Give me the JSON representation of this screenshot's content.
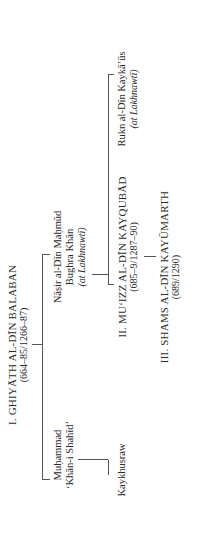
{
  "diagram": {
    "type": "genealogical-tree",
    "orientation": "rotated-90-ccw",
    "nodes": {
      "balaban": {
        "name": "I. GHIYĀTH AL-DĪN BALABAN",
        "dates": "(664–85/1266–87)"
      },
      "muhammad": {
        "line1": "Muḥammad",
        "line2": "ʻKhān-i Shahīdʼ"
      },
      "nasir": {
        "line1": "Nāṣir al-Dīn Maḥmūd",
        "line2": "Bughra Khān",
        "note": "(at Lakhnawtī)"
      },
      "kaykhusraw": {
        "name": "Kaykhusraw"
      },
      "muizz": {
        "name": "II. MUʻIZZ AL-DĪN KAYQUBĀD",
        "dates": "(685–9/1287–90)"
      },
      "rukn": {
        "name": "Rukn al-Dīn Kaykāʼūs",
        "note": "(at Lakhnawtī)"
      },
      "shams": {
        "name": "III. SHAMS AL-DĪN KAYŪMARTH",
        "dates": "(689/1290)"
      }
    },
    "edges": [
      [
        "balaban",
        "muhammad"
      ],
      [
        "balaban",
        "nasir"
      ],
      [
        "muhammad",
        "kaykhusraw"
      ],
      [
        "nasir",
        "muizz"
      ],
      [
        "nasir",
        "rukn"
      ],
      [
        "muizz",
        "shams"
      ]
    ],
    "colors": {
      "text": "#2a2a2a",
      "lines": "#555555",
      "background": "#ffffff"
    }
  }
}
